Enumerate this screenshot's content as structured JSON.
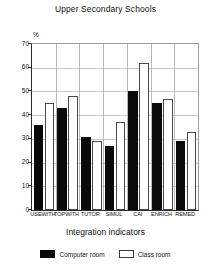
{
  "chart_data": {
    "type": "bar",
    "title": "Upper Secondary Schools",
    "xlabel": "Integration indicators",
    "ylabel": "%",
    "ylim": [
      0,
      70
    ],
    "yticks": [
      0,
      10,
      20,
      30,
      40,
      50,
      60,
      70
    ],
    "grid": true,
    "legend_position": "bottom",
    "categories": [
      "USEWITH",
      "TOPWITH",
      "TUTOR",
      "SIMUL",
      "CAI",
      "ENRICH",
      "REMED"
    ],
    "series": [
      {
        "name": "Computer room",
        "color": "#0a0a0a",
        "values": [
          36,
          43,
          31,
          27,
          50,
          45,
          29
        ]
      },
      {
        "name": "Class room",
        "color": "#ffffff",
        "values": [
          45,
          48,
          29,
          37,
          62,
          47,
          33
        ]
      }
    ]
  },
  "legend": {
    "items": [
      {
        "label": "Computer room",
        "style": "computer"
      },
      {
        "label": "Class room",
        "style": "classroom"
      }
    ]
  }
}
